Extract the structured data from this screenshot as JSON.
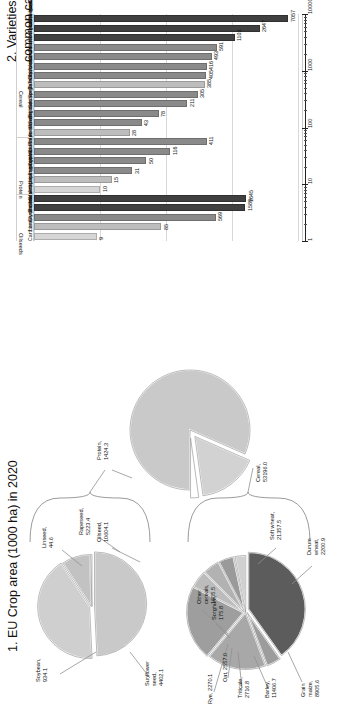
{
  "figure2": {
    "title_line1": "2. Varieties registered in the EU",
    "title_line2": "common catalogue as of 2020",
    "axis": {
      "type": "log",
      "ticks": [
        "1",
        "10",
        "100",
        "1000",
        "10000"
      ],
      "min": 1,
      "max": 10000
    },
    "groups": [
      {
        "name": "Cereal",
        "count": 13
      },
      {
        "name": "Protein",
        "count": 6
      },
      {
        "name": "Oilseeds",
        "count": 5
      }
    ]
  },
  "figure1": {
    "title": "1. EU Crop area (1000 ha) in 2020"
  },
  "chart_data": [
    {
      "type": "bar",
      "title": "2. Varieties registered in the EU common catalogue as of 2020",
      "xlabel": "",
      "ylabel": "",
      "yscale": "log",
      "ylim": [
        1,
        10000
      ],
      "ytick_labels": [
        "1",
        "10",
        "100",
        "1000",
        "10000"
      ],
      "grid": true,
      "categories": [
        "Zea mays",
        "Triticum aestivum",
        "Hordeum Vulgare (2-rows)",
        "Triticum durum",
        "Hordeum Vulgare (6-rows)",
        "Avena sativa",
        "Oryza sativa",
        "X Triticosecale",
        "Sorghum bicolor",
        "Secale Cereale",
        "Triticum spelta",
        "Avena nuda",
        "Avena strigosa",
        "Pisum sativum",
        "Vicia faba",
        "Lupinus angustifolius",
        "Lupinus albus",
        "Lupinus luteus",
        "Arachis hypogaea",
        "Helianthus annuum",
        "Brassica napus",
        "Glycine max",
        "Linus usitatissimum",
        "Carthamus tinctorius"
      ],
      "values": [
        7057,
        2647,
        1103,
        591,
        493,
        416,
        405,
        385,
        305,
        211,
        78,
        43,
        28,
        411,
        116,
        50,
        31,
        15,
        10,
        1645,
        1589,
        569,
        85,
        9
      ],
      "group_of": [
        "Cereal",
        "Cereal",
        "Cereal",
        "Cereal",
        "Cereal",
        "Cereal",
        "Cereal",
        "Cereal",
        "Cereal",
        "Cereal",
        "Cereal",
        "Cereal",
        "Cereal",
        "Protein",
        "Protein",
        "Protein",
        "Protein",
        "Protein",
        "Protein",
        "Oilseeds",
        "Oilseeds",
        "Oilseeds",
        "Oilseeds",
        "Oilseeds"
      ],
      "group_labels": [
        "Cereal",
        "Protein",
        "Oilseeds"
      ]
    },
    {
      "type": "pie",
      "name": "eu-crop-area-overview",
      "title": "1. EU Crop area (1000 ha) in 2020",
      "labels": [
        "Cereal",
        "Oilseed",
        "Protein"
      ],
      "values": [
        53196.0,
        10604.1,
        1424.3
      ],
      "data_labels": [
        "Cereal, 53196.0",
        "Oilseed, 10604.1",
        "Protein, 1424.3"
      ],
      "exploded": [
        false,
        true,
        true
      ]
    },
    {
      "type": "pie",
      "name": "cereal-breakdown",
      "title": "Cereal",
      "labels": [
        "Soft wheat",
        "Durum wheat",
        "Grain maize",
        "Barley",
        "Triticale",
        "Oat",
        "Rye",
        "Sorghum",
        "Other cereals"
      ],
      "values": [
        21357.5,
        2200.9,
        8905.6,
        11406.7,
        2716.8,
        2557.0,
        2270.1,
        175.8,
        1605.5
      ],
      "data_labels": [
        "Soft wheat, 21357.5",
        "Durum wheat, 2200.9",
        "Grain maize, 8905.6",
        "Barley, 11406.7",
        "Triticale, 2716.8",
        "Oat, 2557.0",
        "Rye, 2270.1",
        "Sorghum, 175.8",
        "Other cereals, 1605.5"
      ]
    },
    {
      "type": "pie",
      "name": "oilseed-breakdown",
      "title": "Oilseed",
      "labels": [
        "Rapeseed",
        "Sunflower seed",
        "Soybean",
        "Linseed"
      ],
      "values": [
        5223.4,
        4402.1,
        934.1,
        44.6
      ],
      "data_labels": [
        "Rapeseed, 5223.4",
        "Sunflower seed, 4402.1",
        "Soybean, 934.1",
        "Linseed, 44.6"
      ]
    }
  ]
}
